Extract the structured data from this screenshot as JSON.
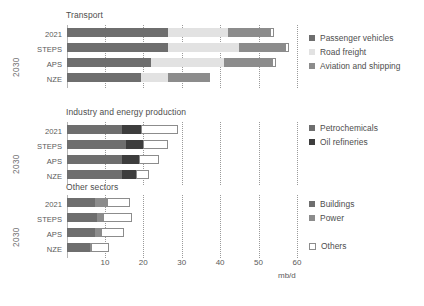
{
  "axis": {
    "unit": "mb/d",
    "ticks": [
      10,
      20,
      30,
      40,
      50,
      60
    ],
    "tick_labels": [
      "10",
      "20",
      "30",
      "40",
      "50",
      "60"
    ],
    "xlim": [
      0,
      62
    ],
    "origin_px": 66.5,
    "px_per_unit": 3.84
  },
  "group_label": "2030",
  "categories": [
    "2021",
    "STEPS",
    "APS",
    "NZE"
  ],
  "colors": {
    "dark_grey": "#6e6e6e",
    "light_grey": "#e2e2e2",
    "mid_grey": "#8c8c8c",
    "very_dark": "#3d3d3d",
    "white_fill": "#ffffff",
    "outline": "#8c8c8c",
    "gridline": "#9a9a9a",
    "text": "#5a5a5a"
  },
  "panels": [
    {
      "id": "transport",
      "title": "Transport",
      "legend": [
        {
          "label": "Passenger vehicles",
          "color": "#6e6e6e"
        },
        {
          "label": "Road freight",
          "color": "#e2e2e2"
        },
        {
          "label": "Aviation and shipping",
          "color": "#8c8c8c"
        }
      ]
    },
    {
      "id": "industry",
      "title": "Industry and energy production",
      "legend": [
        {
          "label": "Petrochemicals",
          "color": "#6e6e6e"
        },
        {
          "label": "Oil refineries",
          "color": "#3d3d3d"
        }
      ]
    },
    {
      "id": "other-sectors",
      "title": "Other sectors",
      "legend": [
        {
          "label": "Buildings",
          "color": "#6e6e6e"
        },
        {
          "label": "Power",
          "color": "#8c8c8c"
        },
        {
          "label": "Others",
          "color": "#ffffff"
        }
      ]
    }
  ],
  "chart_data": {
    "type": "bar",
    "orientation": "horizontal",
    "stacked": true,
    "title": "",
    "xlabel": "mb/d",
    "ylabel": "",
    "xlim": [
      0,
      62
    ],
    "grid": "vertical-dotted",
    "legend_position": "right",
    "categories": [
      "2021",
      "STEPS",
      "APS",
      "NZE"
    ],
    "panels": [
      {
        "title": "Transport",
        "series": [
          {
            "name": "Passenger vehicles",
            "color": "#6e6e6e",
            "values": [
              26.5,
              26.5,
              22.0,
              19.5
            ]
          },
          {
            "name": "Road freight",
            "color": "#e2e2e2",
            "values": [
              15.5,
              18.5,
              19.0,
              7.0
            ]
          },
          {
            "name": "Aviation and shipping",
            "color": "#8c8c8c",
            "values": [
              11.0,
              12.0,
              12.5,
              11.0
            ]
          },
          {
            "name": "Others",
            "color": "#ffffff",
            "values": [
              1.0,
              1.0,
              1.0,
              0.0
            ]
          }
        ],
        "totals": [
          54.0,
          58.0,
          54.5,
          37.5
        ]
      },
      {
        "title": "Industry and energy production",
        "series": [
          {
            "name": "Petrochemicals",
            "color": "#6e6e6e",
            "values": [
              14.5,
              15.5,
              14.5,
              14.5
            ]
          },
          {
            "name": "Oil refineries",
            "color": "#3d3d3d",
            "values": [
              5.0,
              4.5,
              4.5,
              3.5
            ]
          },
          {
            "name": "Others",
            "color": "#ffffff",
            "values": [
              9.5,
              6.5,
              5.0,
              3.5
            ]
          }
        ],
        "totals": [
          29.0,
          26.5,
          24.0,
          21.5
        ]
      },
      {
        "title": "Other sectors",
        "series": [
          {
            "name": "Buildings",
            "color": "#6e6e6e",
            "values": [
              7.5,
              8.0,
              7.5,
              6.0
            ]
          },
          {
            "name": "Power",
            "color": "#8c8c8c",
            "values": [
              3.0,
              1.5,
              1.5,
              0.5
            ]
          },
          {
            "name": "Others",
            "color": "#ffffff",
            "values": [
              6.0,
              7.5,
              6.0,
              4.5
            ]
          }
        ],
        "totals": [
          16.5,
          17.0,
          15.0,
          11.0
        ]
      }
    ]
  }
}
